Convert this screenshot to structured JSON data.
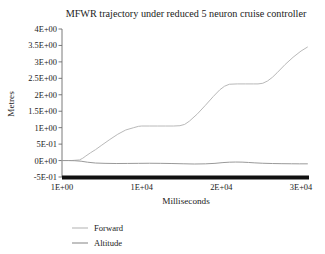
{
  "chart_data": {
    "type": "line",
    "title": "MFWR trajectory under reduced 5 neuron cruise controller",
    "xlabel": "Milliseconds",
    "ylabel": "Metres",
    "xlim": [
      1,
      31000
    ],
    "ylim": [
      -0.5,
      4.0
    ],
    "grid": false,
    "legend_position": "bottom-left",
    "x_ticks": [
      {
        "value": 1,
        "label": "1E+00"
      },
      {
        "value": 10000,
        "label": "1E+04"
      },
      {
        "value": 20000,
        "label": "2E+04"
      },
      {
        "value": 30000,
        "label": "3E+04"
      }
    ],
    "y_ticks": [
      {
        "value": 4.0,
        "label": "4E+00"
      },
      {
        "value": 3.5,
        "label": "3.5E+00"
      },
      {
        "value": 3.0,
        "label": "3E+00"
      },
      {
        "value": 2.5,
        "label": "2.5E+00"
      },
      {
        "value": 2.0,
        "label": "2E+00"
      },
      {
        "value": 1.5,
        "label": "1.5E+00"
      },
      {
        "value": 1.0,
        "label": "1E+00"
      },
      {
        "value": 0.5,
        "label": "5E-01"
      },
      {
        "value": 0.0,
        "label": "0E+00"
      },
      {
        "value": -0.5,
        "label": "-5E-01"
      }
    ],
    "series": [
      {
        "name": "Forward",
        "color": "#b9b9b9",
        "x": [
          1,
          1200,
          2200,
          2600,
          3000,
          3600,
          4200,
          5000,
          6000,
          7000,
          8000,
          9000,
          9600,
          10000,
          11000,
          12000,
          13000,
          14000,
          14800,
          15400,
          16000,
          17000,
          18000,
          19000,
          19800,
          20400,
          21000,
          22000,
          23000,
          24000,
          24600,
          25200,
          25800,
          26400,
          27000,
          28000,
          29000,
          30000,
          30800
        ],
        "y": [
          0.0,
          0.0,
          0.02,
          0.07,
          0.14,
          0.24,
          0.33,
          0.47,
          0.64,
          0.8,
          0.93,
          1.0,
          1.04,
          1.05,
          1.05,
          1.05,
          1.05,
          1.05,
          1.06,
          1.1,
          1.2,
          1.42,
          1.68,
          1.95,
          2.15,
          2.26,
          2.32,
          2.33,
          2.33,
          2.33,
          2.33,
          2.35,
          2.42,
          2.53,
          2.67,
          2.92,
          3.14,
          3.33,
          3.45
        ]
      },
      {
        "name": "Altitude",
        "color": "#9a9a9a",
        "x": [
          1,
          800,
          1600,
          2400,
          3200,
          4200,
          5400,
          6800,
          8200,
          9600,
          11000,
          12400,
          13800,
          15200,
          16600,
          18000,
          19200,
          20200,
          21000,
          21800,
          22600,
          23400,
          24200,
          25200,
          26400,
          27600,
          28800,
          29800,
          30800
        ],
        "y": [
          0.0,
          0.0,
          -0.005,
          -0.02,
          -0.05,
          -0.075,
          -0.085,
          -0.09,
          -0.088,
          -0.085,
          -0.082,
          -0.085,
          -0.09,
          -0.098,
          -0.105,
          -0.1,
          -0.085,
          -0.062,
          -0.05,
          -0.045,
          -0.048,
          -0.058,
          -0.07,
          -0.082,
          -0.09,
          -0.095,
          -0.098,
          -0.1,
          -0.1
        ]
      }
    ],
    "legend": [
      {
        "label": "Forward",
        "color": "#b9b9b9"
      },
      {
        "label": "Altitude",
        "color": "#8f8f8f"
      }
    ],
    "axis_colors": {
      "y_axis": "#6b6b6b",
      "x_axis": "#111111",
      "tick": "#6b6b6b"
    }
  }
}
